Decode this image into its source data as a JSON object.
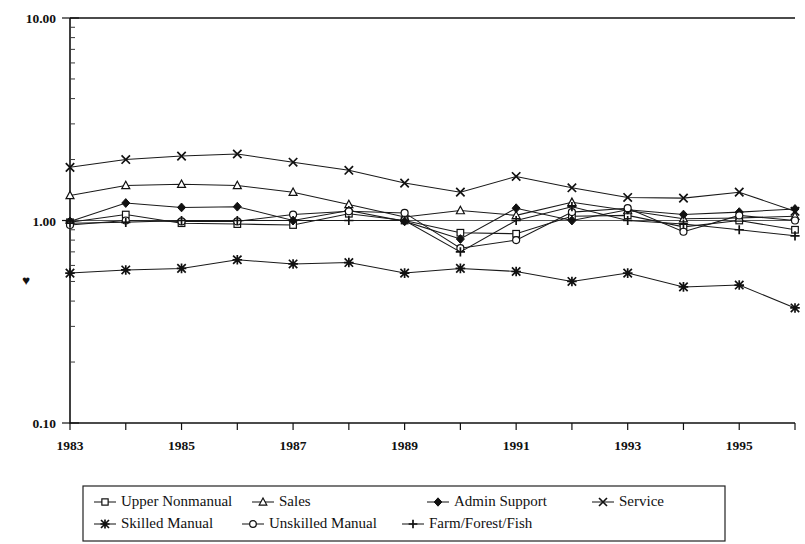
{
  "chart_data": {
    "type": "line",
    "title": "",
    "xlabel": "",
    "ylabel": "",
    "yscale": "log",
    "ylim": [
      0.1,
      10.0
    ],
    "ytick_labels": [
      "10.00",
      "1.00",
      "0.10"
    ],
    "ytick_values": [
      10.0,
      1.0,
      0.1
    ],
    "grid": false,
    "reference_line": 1.0,
    "legend_position": "bottom",
    "x": [
      1983,
      1984,
      1985,
      1986,
      1987,
      1988,
      1989,
      1990,
      1991,
      1992,
      1993,
      1994,
      1995,
      1996
    ],
    "xtick_labels": [
      "1983",
      "1985",
      "1987",
      "1989",
      "1991",
      "1993",
      "1995"
    ],
    "xtick_values": [
      1983,
      1985,
      1987,
      1989,
      1991,
      1993,
      1995
    ],
    "series": [
      {
        "name": "Upper Nonmanual",
        "marker": "square",
        "values": [
          0.98,
          1.07,
          0.97,
          0.96,
          0.95,
          1.08,
          1.0,
          0.87,
          0.86,
          1.05,
          1.06,
          0.93,
          1.0,
          0.9
        ]
      },
      {
        "name": "Sales",
        "marker": "triangle",
        "values": [
          1.33,
          1.49,
          1.51,
          1.49,
          1.38,
          1.2,
          1.04,
          1.12,
          1.06,
          1.23,
          1.12,
          1.02,
          1.03,
          1.05
        ]
      },
      {
        "name": "Admin Support",
        "marker": "diamond",
        "values": [
          0.99,
          1.22,
          1.16,
          1.17,
          1.0,
          1.12,
          0.99,
          0.81,
          1.15,
          1.0,
          1.13,
          1.07,
          1.1,
          1.14
        ]
      },
      {
        "name": "Service",
        "marker": "x",
        "values": [
          1.83,
          2.0,
          2.08,
          2.13,
          1.94,
          1.77,
          1.53,
          1.38,
          1.65,
          1.45,
          1.3,
          1.29,
          1.38,
          1.11
        ]
      },
      {
        "name": "Skilled Manual",
        "marker": "star",
        "values": [
          0.55,
          0.57,
          0.58,
          0.64,
          0.61,
          0.62,
          0.55,
          0.58,
          0.56,
          0.5,
          0.55,
          0.47,
          0.48,
          0.37
        ]
      },
      {
        "name": "Unskilled Manual",
        "marker": "circle",
        "values": [
          0.95,
          1.0,
          0.99,
          0.99,
          1.07,
          1.11,
          1.09,
          0.73,
          0.8,
          1.1,
          1.15,
          0.88,
          1.06,
          1.0
        ]
      },
      {
        "name": "Farm/Forest/Fish",
        "marker": "plus",
        "values": [
          0.97,
          0.98,
          1.0,
          1.0,
          1.0,
          1.0,
          1.0,
          0.7,
          1.0,
          1.17,
          1.0,
          0.96,
          0.9,
          0.84
        ]
      }
    ]
  },
  "legend": {
    "rows": [
      [
        {
          "label": "Upper Nonmanual",
          "marker": "square"
        },
        {
          "label": "Sales",
          "marker": "triangle"
        },
        {
          "label": "Admin Support",
          "marker": "diamond"
        },
        {
          "label": "Service",
          "marker": "x"
        }
      ],
      [
        {
          "label": "Skilled Manual",
          "marker": "star"
        },
        {
          "label": "Unskilled Manual",
          "marker": "circle"
        },
        {
          "label": "Farm/Forest/Fish",
          "marker": "plus"
        }
      ]
    ]
  },
  "colors": {
    "ink": "#111111",
    "background": "#ffffff",
    "grid": "#555555"
  }
}
